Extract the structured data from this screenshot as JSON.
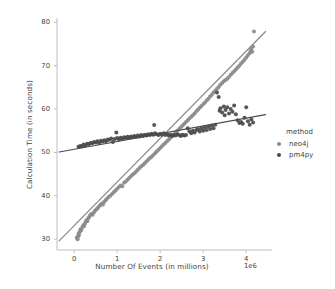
{
  "chart_data": {
    "type": "scatter",
    "title": "",
    "xlabel": "Number Of Events (in millions)",
    "ylabel": "Calculation Time (in seconds)",
    "x_exponent_label": "1e6",
    "xlim": [
      -400000,
      4600000
    ],
    "ylim": [
      27.5,
      81
    ],
    "xticks": [
      0,
      1,
      2,
      3,
      4
    ],
    "xtick_labels": [
      "0",
      "1",
      "2",
      "3",
      "4"
    ],
    "yticks": [
      30,
      40,
      50,
      60,
      70,
      80
    ],
    "ytick_labels": [
      "30",
      "40",
      "50",
      "60",
      "70",
      "80"
    ],
    "grid": false,
    "legend": {
      "title": "method",
      "position": "right-outside",
      "entries": [
        {
          "label": "neo4j",
          "color": "#8a8a8a"
        },
        {
          "label": "pm4py",
          "color": "#4a4a4a"
        }
      ]
    },
    "series": [
      {
        "name": "neo4j",
        "color": "#8a8a8a",
        "marker": "circle",
        "regression": {
          "x0": -0.35,
          "y0": 29.6,
          "x1": 4.45,
          "y1": 77.9,
          "slope_per_1e6": 10.06,
          "intercept": 33.1
        },
        "points": [
          [
            0.06,
            30.3
          ],
          [
            0.08,
            30.0
          ],
          [
            0.09,
            30.6
          ],
          [
            0.1,
            31.2
          ],
          [
            0.11,
            30.9
          ],
          [
            0.12,
            31.6
          ],
          [
            0.14,
            31.9
          ],
          [
            0.15,
            32.3
          ],
          [
            0.17,
            32.1
          ],
          [
            0.19,
            32.8
          ],
          [
            0.21,
            33.2
          ],
          [
            0.23,
            33.0
          ],
          [
            0.25,
            33.6
          ],
          [
            0.27,
            34.1
          ],
          [
            0.29,
            34.4
          ],
          [
            0.31,
            34.2
          ],
          [
            0.33,
            34.9
          ],
          [
            0.35,
            35.1
          ],
          [
            0.37,
            35.5
          ],
          [
            0.4,
            35.8
          ],
          [
            0.43,
            35.6
          ],
          [
            0.46,
            36.2
          ],
          [
            0.49,
            36.6
          ],
          [
            0.52,
            36.9
          ],
          [
            0.55,
            37.2
          ],
          [
            0.58,
            37.6
          ],
          [
            0.61,
            37.9
          ],
          [
            0.64,
            38.2
          ],
          [
            0.67,
            38.0
          ],
          [
            0.7,
            38.6
          ],
          [
            0.73,
            39.0
          ],
          [
            0.76,
            39.3
          ],
          [
            0.8,
            39.7
          ],
          [
            0.84,
            40.0
          ],
          [
            0.88,
            40.4
          ],
          [
            0.92,
            40.8
          ],
          [
            0.96,
            41.2
          ],
          [
            1.0,
            41.6
          ],
          [
            1.04,
            42.0
          ],
          [
            1.08,
            42.4
          ],
          [
            1.12,
            42.2
          ],
          [
            1.16,
            43.0
          ],
          [
            1.2,
            43.3
          ],
          [
            1.24,
            43.7
          ],
          [
            1.28,
            44.1
          ],
          [
            1.32,
            44.5
          ],
          [
            1.36,
            44.9
          ],
          [
            1.4,
            45.2
          ],
          [
            1.44,
            45.6
          ],
          [
            1.48,
            46.0
          ],
          [
            1.52,
            46.4
          ],
          [
            1.56,
            46.8
          ],
          [
            1.6,
            47.1
          ],
          [
            1.64,
            47.5
          ],
          [
            1.68,
            47.9
          ],
          [
            1.72,
            48.3
          ],
          [
            1.76,
            48.7
          ],
          [
            1.8,
            49.0
          ],
          [
            1.84,
            49.4
          ],
          [
            1.88,
            49.8
          ],
          [
            1.92,
            50.2
          ],
          [
            1.96,
            50.6
          ],
          [
            2.0,
            51.0
          ],
          [
            2.04,
            51.4
          ],
          [
            2.08,
            51.8
          ],
          [
            2.12,
            52.2
          ],
          [
            2.16,
            52.6
          ],
          [
            2.2,
            53.0
          ],
          [
            2.24,
            53.4
          ],
          [
            2.28,
            53.8
          ],
          [
            2.32,
            54.2
          ],
          [
            2.36,
            54.6
          ],
          [
            2.4,
            55.0
          ],
          [
            2.44,
            55.4
          ],
          [
            2.48,
            55.8
          ],
          [
            2.52,
            56.2
          ],
          [
            2.56,
            56.6
          ],
          [
            2.6,
            57.0
          ],
          [
            2.64,
            57.4
          ],
          [
            2.68,
            57.8
          ],
          [
            2.72,
            58.2
          ],
          [
            2.76,
            58.6
          ],
          [
            2.8,
            59.0
          ],
          [
            2.84,
            59.5
          ],
          [
            2.88,
            59.9
          ],
          [
            2.92,
            60.3
          ],
          [
            2.96,
            60.7
          ],
          [
            3.0,
            61.1
          ],
          [
            3.04,
            61.5
          ],
          [
            3.08,
            62.0
          ],
          [
            3.12,
            62.4
          ],
          [
            3.16,
            62.9
          ],
          [
            3.2,
            63.3
          ],
          [
            3.24,
            63.8
          ],
          [
            3.28,
            64.2
          ],
          [
            3.32,
            64.7
          ],
          [
            3.36,
            65.1
          ],
          [
            3.4,
            65.6
          ],
          [
            3.44,
            66.0
          ],
          [
            3.48,
            66.4
          ],
          [
            3.52,
            66.7
          ],
          [
            3.56,
            67.0
          ],
          [
            3.6,
            67.4
          ],
          [
            3.64,
            67.9
          ],
          [
            3.68,
            68.3
          ],
          [
            3.72,
            68.7
          ],
          [
            3.76,
            69.1
          ],
          [
            3.8,
            69.6
          ],
          [
            3.84,
            70.0
          ],
          [
            3.88,
            70.5
          ],
          [
            3.92,
            70.9
          ],
          [
            3.96,
            71.4
          ],
          [
            4.0,
            71.9
          ],
          [
            4.04,
            72.4
          ],
          [
            4.08,
            72.9
          ],
          [
            4.1,
            73.4
          ],
          [
            4.12,
            73.9
          ],
          [
            4.14,
            73.2
          ],
          [
            4.16,
            74.4
          ],
          [
            4.18,
            77.9
          ]
        ]
      },
      {
        "name": "pm4py",
        "color": "#4a4a4a",
        "marker": "circle",
        "regression": {
          "x0": -0.35,
          "y0": 50.1,
          "x1": 4.45,
          "y1": 58.7,
          "slope_per_1e6": 1.79,
          "intercept": 50.7
        },
        "points": [
          [
            0.1,
            51.3
          ],
          [
            0.14,
            51.5
          ],
          [
            0.18,
            51.4
          ],
          [
            0.22,
            51.8
          ],
          [
            0.26,
            51.6
          ],
          [
            0.3,
            52.0
          ],
          [
            0.34,
            51.9
          ],
          [
            0.38,
            52.2
          ],
          [
            0.42,
            52.1
          ],
          [
            0.46,
            52.4
          ],
          [
            0.5,
            52.3
          ],
          [
            0.54,
            52.6
          ],
          [
            0.58,
            52.2
          ],
          [
            0.62,
            52.7
          ],
          [
            0.66,
            52.5
          ],
          [
            0.7,
            52.8
          ],
          [
            0.74,
            52.6
          ],
          [
            0.78,
            53.0
          ],
          [
            0.82,
            52.9
          ],
          [
            0.86,
            53.2
          ],
          [
            0.9,
            52.4
          ],
          [
            0.94,
            53.1
          ],
          [
            0.98,
            54.6
          ],
          [
            1.0,
            53.3
          ],
          [
            1.04,
            53.0
          ],
          [
            1.08,
            53.4
          ],
          [
            1.12,
            53.2
          ],
          [
            1.16,
            53.5
          ],
          [
            1.2,
            53.3
          ],
          [
            1.24,
            53.6
          ],
          [
            1.28,
            53.4
          ],
          [
            1.32,
            53.7
          ],
          [
            1.36,
            53.5
          ],
          [
            1.4,
            53.8
          ],
          [
            1.44,
            53.6
          ],
          [
            1.48,
            53.9
          ],
          [
            1.52,
            53.7
          ],
          [
            1.56,
            54.0
          ],
          [
            1.6,
            53.8
          ],
          [
            1.64,
            54.1
          ],
          [
            1.68,
            53.9
          ],
          [
            1.72,
            54.2
          ],
          [
            1.76,
            54.0
          ],
          [
            1.8,
            54.3
          ],
          [
            1.84,
            54.1
          ],
          [
            1.86,
            56.3
          ],
          [
            1.88,
            54.4
          ],
          [
            1.92,
            54.2
          ],
          [
            1.96,
            54.0
          ],
          [
            2.0,
            54.3
          ],
          [
            2.04,
            54.1
          ],
          [
            2.08,
            54.4
          ],
          [
            2.12,
            54.0
          ],
          [
            2.16,
            54.2
          ],
          [
            2.2,
            53.9
          ],
          [
            2.24,
            54.1
          ],
          [
            2.28,
            53.8
          ],
          [
            2.32,
            54.0
          ],
          [
            2.36,
            53.9
          ],
          [
            2.4,
            54.2
          ],
          [
            2.44,
            54.0
          ],
          [
            2.48,
            53.8
          ],
          [
            2.52,
            54.1
          ],
          [
            2.56,
            53.9
          ],
          [
            2.6,
            54.0
          ],
          [
            2.64,
            55.6
          ],
          [
            2.68,
            54.9
          ],
          [
            2.72,
            54.4
          ],
          [
            2.76,
            55.0
          ],
          [
            2.8,
            54.6
          ],
          [
            2.84,
            55.2
          ],
          [
            2.88,
            55.4
          ],
          [
            2.92,
            54.8
          ],
          [
            2.96,
            55.6
          ],
          [
            3.0,
            55.0
          ],
          [
            3.04,
            55.8
          ],
          [
            3.08,
            55.2
          ],
          [
            3.12,
            56.0
          ],
          [
            3.16,
            55.4
          ],
          [
            3.2,
            56.2
          ],
          [
            3.24,
            55.6
          ],
          [
            3.28,
            56.4
          ],
          [
            3.32,
            63.8
          ],
          [
            3.36,
            62.8
          ],
          [
            3.38,
            59.6
          ],
          [
            3.4,
            60.2
          ],
          [
            3.44,
            59.2
          ],
          [
            3.48,
            60.6
          ],
          [
            3.5,
            58.6
          ],
          [
            3.52,
            59.8
          ],
          [
            3.56,
            60.4
          ],
          [
            3.6,
            59.0
          ],
          [
            3.64,
            60.0
          ],
          [
            3.68,
            59.4
          ],
          [
            3.72,
            60.8
          ],
          [
            3.76,
            58.8
          ],
          [
            3.8,
            57.4
          ],
          [
            3.84,
            56.8
          ],
          [
            3.88,
            57.0
          ],
          [
            3.92,
            56.6
          ],
          [
            3.96,
            58.0
          ],
          [
            4.0,
            60.4
          ],
          [
            4.04,
            57.2
          ],
          [
            4.08,
            56.4
          ],
          [
            4.12,
            57.6
          ],
          [
            4.16,
            56.9
          ]
        ]
      }
    ]
  }
}
